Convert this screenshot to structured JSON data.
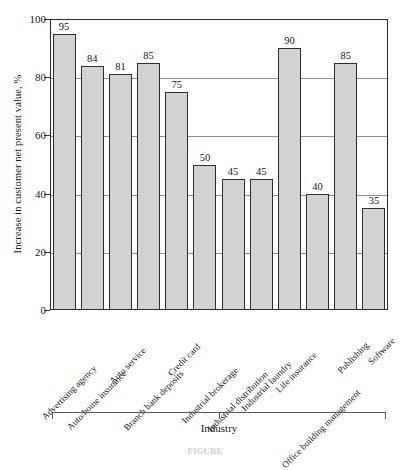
{
  "chart_data": {
    "type": "bar",
    "title": "",
    "xlabel": "Industry",
    "ylabel": "Increase in customer net present value, %",
    "ylim": [
      0,
      100
    ],
    "ytick_labels": [
      "0",
      "20",
      "40",
      "60",
      "80",
      "100"
    ],
    "ytick_values": [
      0,
      20,
      40,
      60,
      80,
      100
    ],
    "gridlines": [
      20,
      40,
      60,
      80
    ],
    "grid": true,
    "legend": "none",
    "bar_fill_color": "#d2d2d2",
    "bar_edge_color": "#2f2f2f",
    "categories": [
      "Advertising agency",
      "Auto/home insurance",
      "Auto service",
      "Branch bank deposits",
      "Credit card",
      "Industrial brokerage",
      "Industrial distribution",
      "Industrial laundry",
      "Life insurance",
      "Office building management",
      "Publishing",
      "Software"
    ],
    "values": [
      95,
      84,
      81,
      85,
      75,
      50,
      45,
      45,
      90,
      40,
      85,
      35
    ],
    "data_labels": [
      "95",
      "84",
      "81",
      "85",
      "75",
      "50",
      "45",
      "45",
      "90",
      "40",
      "85",
      "35"
    ]
  },
  "figure": {
    "caption": "FIGURE"
  }
}
